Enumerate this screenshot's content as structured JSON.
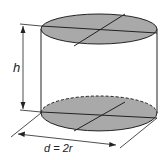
{
  "diagram": {
    "type": "cylinder",
    "labels": {
      "height": "h",
      "diameter": "d = 2r"
    },
    "colors": {
      "face_fill": "#a9a9a9",
      "stroke": "#222222",
      "background": "#ffffff"
    }
  }
}
